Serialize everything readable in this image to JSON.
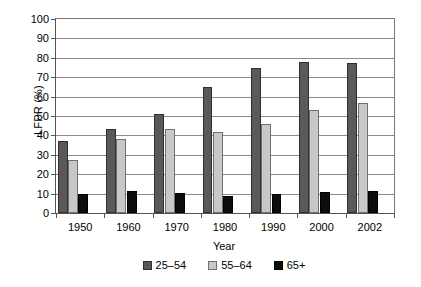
{
  "chart_data": {
    "type": "bar",
    "title": "",
    "xlabel": "Year",
    "ylabel": "LFPR (%)",
    "categories": [
      "1950",
      "1960",
      "1970",
      "1980",
      "1990",
      "2000",
      "2002"
    ],
    "ylim": [
      0,
      100
    ],
    "ytick_step": 10,
    "yticks": [
      "100",
      "90",
      "80",
      "70",
      "60",
      "50",
      "40",
      "30",
      "20",
      "10",
      "0"
    ],
    "grid": "horizontal",
    "legend_position": "bottom",
    "series": [
      {
        "name": "25–54",
        "color": "#595959",
        "values": [
          37,
          43.5,
          51,
          65,
          75,
          78,
          77.5
        ]
      },
      {
        "name": "55–64",
        "color": "#c8c8c8",
        "values": [
          27.5,
          38,
          43.5,
          42,
          46,
          53,
          56.5
        ]
      },
      {
        "name": "65+",
        "color": "#0d0d0d",
        "values": [
          10,
          11.5,
          10.5,
          9,
          9.8,
          10.8,
          11.3
        ]
      }
    ]
  }
}
